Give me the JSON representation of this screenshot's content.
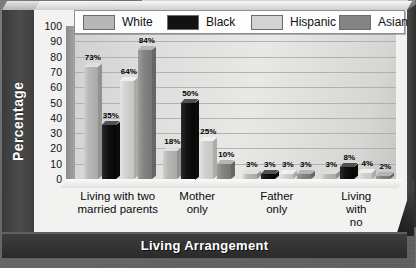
{
  "chart_data": {
    "type": "bar",
    "title": "",
    "xlabel": "Living Arrangement",
    "ylabel": "Percentage",
    "ylim": [
      0,
      100
    ],
    "yticks": [
      100,
      90,
      80,
      70,
      60,
      50,
      40,
      30,
      20,
      10,
      0
    ],
    "grid": true,
    "legend_position": "top",
    "value_suffix": "%",
    "categories": [
      "Living with two\nmarried parents",
      "Mother\nonly",
      "Father\nonly",
      "Living with\nno parent"
    ],
    "series": [
      {
        "name": "White",
        "color": "#b7b7b5",
        "values": [
          73,
          18,
          3,
          3
        ],
        "labels": [
          "73%",
          "18%",
          "3%",
          "3%"
        ]
      },
      {
        "name": "Black",
        "color": "#121212",
        "values": [
          35,
          50,
          3,
          8
        ],
        "labels": [
          "35%",
          "50%",
          "3%",
          "8%"
        ]
      },
      {
        "name": "Hispanic",
        "color": "#d2d2d0",
        "values": [
          64,
          25,
          3,
          4
        ],
        "labels": [
          "64%",
          "25%",
          "3%",
          "4%"
        ]
      },
      {
        "name": "Asian",
        "color": "#848482",
        "values": [
          84,
          10,
          3,
          2
        ],
        "labels": [
          "84%",
          "10%",
          "3%",
          "2%"
        ]
      }
    ]
  },
  "legend": {
    "items": [
      {
        "label": "White",
        "swatch": "#b7b7b5"
      },
      {
        "label": "Black",
        "swatch": "#121212"
      },
      {
        "label": "Hispanic",
        "swatch": "#d2d2d0"
      },
      {
        "label": "Asian",
        "swatch": "#848482"
      }
    ]
  },
  "axes": {
    "y_title": "Percentage",
    "x_title": "Living Arrangement"
  }
}
